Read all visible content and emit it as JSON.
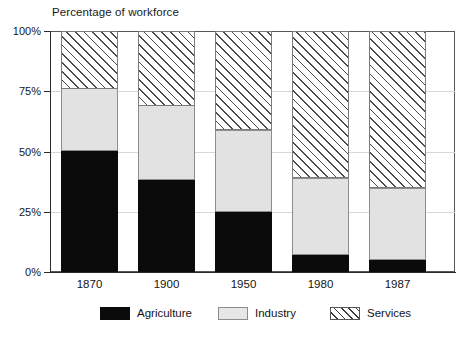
{
  "chart_data": {
    "type": "bar",
    "subtype": "stacked-bar-percentage",
    "title": "Percentage of workforce",
    "xlabel": "",
    "ylabel": "",
    "categories": [
      "1870",
      "1900",
      "1950",
      "1980",
      "1987"
    ],
    "series": [
      {
        "name": "Agriculture",
        "values": [
          50,
          38,
          25,
          7,
          5
        ],
        "color": "#0b0b0b",
        "fill": "solid-black"
      },
      {
        "name": "Industry",
        "values": [
          26,
          31,
          34,
          32,
          30
        ],
        "color": "#e2e2e2",
        "fill": "light-gray"
      },
      {
        "name": "Services",
        "values": [
          24,
          31,
          41,
          61,
          65
        ],
        "color": "#ffffff",
        "fill": "diagonal-hatch"
      }
    ],
    "ylim": [
      0,
      100
    ],
    "yticks": [
      0,
      25,
      50,
      75,
      100
    ],
    "ytick_labels": [
      "0%",
      "25%",
      "75%",
      "50%",
      "100%"
    ],
    "grid": true,
    "legend_position": "bottom"
  },
  "axis": {
    "y_ticks": [
      {
        "label": "100%",
        "value": 100
      },
      {
        "label": "75%",
        "value": 75
      },
      {
        "label": "50%",
        "value": 50
      },
      {
        "label": "25%",
        "value": 25
      },
      {
        "label": "0%",
        "value": 0
      }
    ],
    "x_ticks": [
      {
        "label": "1870"
      },
      {
        "label": "1900"
      },
      {
        "label": "1950"
      },
      {
        "label": "1980"
      },
      {
        "label": "1987"
      }
    ]
  },
  "legend": {
    "items": [
      {
        "label": "Agriculture",
        "swatch": "solid-black-swatch"
      },
      {
        "label": "Industry",
        "swatch": "light-gray-swatch"
      },
      {
        "label": "Services",
        "swatch": "diagonal-hatch-swatch"
      }
    ]
  }
}
